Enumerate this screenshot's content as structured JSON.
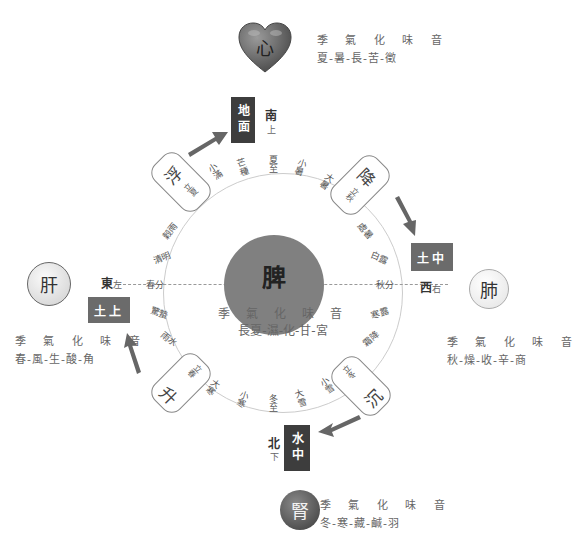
{
  "title_fragment": "▔▔▔ ▔▔▔▔▔",
  "center": {
    "organ": "脾",
    "header": "季 氣 化 味 音",
    "values": "長夏-濕-化-甘-宮"
  },
  "organs": {
    "heart": {
      "label": "心",
      "header": "季 氣 化 味 音",
      "values": "夏-暑-長-苦-徵"
    },
    "liver": {
      "label": "肝",
      "header": "季 氣 化 味 音",
      "values": "春-風-生-酸-角"
    },
    "lung": {
      "label": "肺",
      "header": "季 氣 化 味 音",
      "values": "秋-燥-收-辛-商"
    },
    "kidney": {
      "label": "腎",
      "header": "季 氣 化 味 音",
      "values": "冬-寒-藏-鹹-羽"
    }
  },
  "directions": {
    "south": {
      "box": "地面",
      "label": "南",
      "sub": "上"
    },
    "west": {
      "box": "土中",
      "label": "西",
      "sub": "右"
    },
    "east": {
      "box": "土上",
      "label": "東",
      "sub": "左"
    },
    "north": {
      "box": "水中",
      "label": "北",
      "sub": "下"
    }
  },
  "pills": {
    "float": {
      "big": "浮",
      "small": "立夏"
    },
    "descend": {
      "big": "降",
      "small": "立秋"
    },
    "sink": {
      "big": "沉",
      "small": "立冬"
    },
    "rise": {
      "big": "升",
      "small": "立春"
    }
  },
  "solar_terms": {
    "top": [
      "小滿",
      "芒種",
      "夏至",
      "小暑",
      "大暑"
    ],
    "right": [
      "處暑",
      "白露",
      "秋分",
      "寒露",
      "霜降"
    ],
    "bottom": [
      "大寒",
      "小寒",
      "冬至",
      "大雪",
      "小雪"
    ],
    "left": [
      "穀雨",
      "清明",
      "春分",
      "驚蟄",
      "雨水"
    ]
  },
  "colors": {
    "dark_box": "#3d3d3d",
    "mid_box": "#6b6b6b",
    "spleen": "#808080",
    "heart": "#6e6e6e",
    "arrow": "#666666"
  }
}
